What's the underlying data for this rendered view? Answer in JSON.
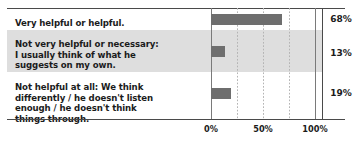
{
  "chart_data": {
    "type": "bar",
    "orientation": "horizontal",
    "title": "",
    "xlabel": "",
    "ylabel": "",
    "xlim": [
      0,
      100
    ],
    "grid": true,
    "gridlines": [
      "25%",
      "50%",
      "75%"
    ],
    "legend": "none",
    "axis_ticks": [
      "0%",
      "50%",
      "100%"
    ],
    "categories": [
      "Very helpful or helpful.",
      "Not very helpful or necessary: I usually think of what he suggests on my own.",
      "Not helpful at all: We think differently / he doesn't listen enough / he doesn't think things through."
    ],
    "values": [
      68,
      13,
      19
    ],
    "value_labels": [
      "68%",
      "13%",
      "19%"
    ],
    "bar_color": "#6e6e6e",
    "band_color": "#dedede",
    "rule_color": "#4a4a4a"
  },
  "rows": [
    {
      "label_lines": [
        "Very helpful or helpful."
      ],
      "label": "Very helpful or helpful.",
      "value": 68,
      "value_label": "68%",
      "shaded": false
    },
    {
      "label_lines": [
        "Not very helpful or necessary:",
        "I usually think of what he",
        "suggests on my own."
      ],
      "label": "Not very helpful or necessary: I usually think of what he suggests on my own.",
      "value": 13,
      "value_label": "13%",
      "shaded": true
    },
    {
      "label_lines": [
        "Not helpful at all: We think",
        "differently / he doesn't listen",
        "enough / he doesn't think",
        "things through."
      ],
      "label": "Not helpful at all: We think differently / he doesn't listen enough / he doesn't think things through.",
      "value": 19,
      "value_label": "19%",
      "shaded": false
    }
  ],
  "axis": {
    "tick_0": "0%",
    "tick_50": "50%",
    "tick_100": "100%"
  }
}
